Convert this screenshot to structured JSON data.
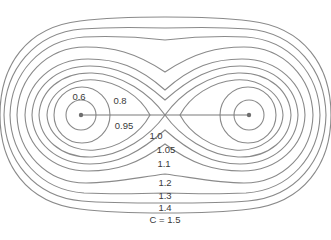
{
  "diagram": {
    "type": "contour-diagram",
    "colors": {
      "line": "#8a8a8a",
      "text": "#3a3a3a",
      "background": "#ffffff"
    },
    "masses": [
      {
        "name": "left-mass",
        "x": 81,
        "y": 115
      },
      {
        "name": "right-mass",
        "x": 249,
        "y": 115
      }
    ],
    "labels": {
      "c06": "0.6",
      "c08": "0.8",
      "c095": "0.95",
      "c10": "1.0",
      "c105": "1.05",
      "c11": "1.1",
      "c12": "1.2",
      "c13": "1.3",
      "c14": "1.4",
      "c15": "C = 1.5"
    },
    "contour_levels": [
      0.6,
      0.8,
      0.95,
      1.0,
      1.05,
      1.1,
      1.2,
      1.3,
      1.4,
      1.5
    ]
  }
}
